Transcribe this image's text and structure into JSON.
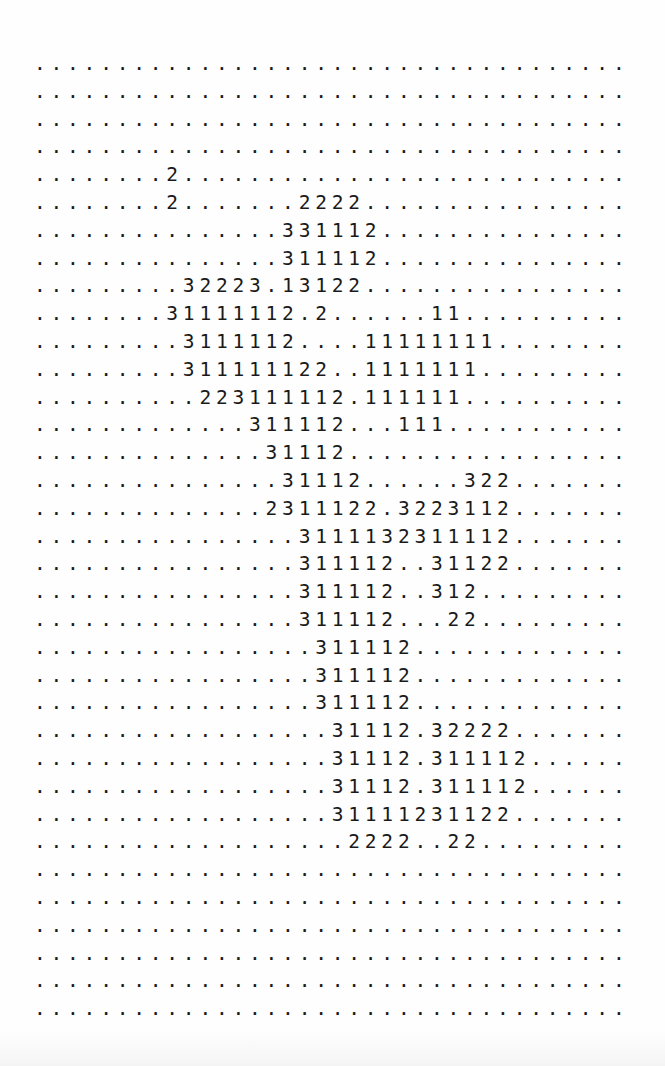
{
  "document": {
    "type": "ascii-grid-printout",
    "columns": 36,
    "row_count": 35,
    "rows": [
      "....................................",
      "....................................",
      "....................................",
      "....................................",
      "........2...........................",
      "........2.......2222................",
      "...............331112...............",
      "...............311112...............",
      ".........32223.13122................",
      "........31111112.2......11..........",
      ".........3111112....11111111........",
      ".........311111122..1111111.........",
      "..........223111112.111111..........",
      ".............311112...111...........",
      "..............31112.................",
      "...............31112......322.......",
      "..............2311122.3223112.......",
      "................3111132311112.......",
      "................311112..31122.......",
      "................311112..312.........",
      "................311112...22.........",
      ".................311112.............",
      ".................311112.............",
      ".................311112.............",
      "..................31112.32222.......",
      "..................31112.311112......",
      "..................31112.311112......",
      "..................31111231122.......",
      "...................2222..22.........",
      "....................................",
      "....................................",
      "....................................",
      "....................................",
      "....................................",
      "...................................."
    ]
  }
}
